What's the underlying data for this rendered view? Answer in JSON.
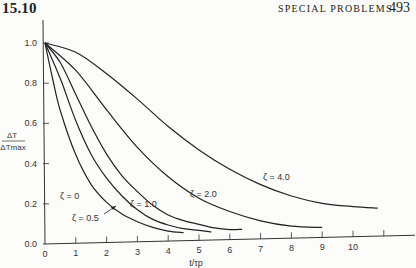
{
  "header": {
    "section": "15.10",
    "running_title": "SPECIAL PROBLEMS",
    "page_number": "493"
  },
  "chart_data": {
    "type": "line",
    "title": "",
    "xlabel": "t/τp",
    "ylabel": "ΔT / ΔTmax",
    "xlim": [
      0,
      11
    ],
    "ylim": [
      0,
      1.0
    ],
    "x_ticks": [
      "0",
      "1",
      "2",
      "3",
      "4",
      "5",
      "6",
      "7",
      "8",
      "9",
      "10",
      ""
    ],
    "y_ticks": [
      "0.0",
      "0.2",
      "0.4",
      "0.6",
      "0.8",
      "1.0"
    ],
    "grid": false,
    "legend": "inline curve labels",
    "series": [
      {
        "name": "ζ = 0",
        "label": "ζ = 0",
        "x": [
          0,
          0.25,
          0.5,
          1,
          1.5,
          2,
          2.5,
          3,
          3.5,
          4,
          4.5
        ],
        "y": [
          1.0,
          0.82,
          0.66,
          0.44,
          0.29,
          0.2,
          0.14,
          0.1,
          0.07,
          0.05,
          0.04
        ]
      },
      {
        "name": "ζ = 0.5",
        "label": "ζ = 0.5",
        "x": [
          0,
          0.5,
          1,
          1.5,
          2,
          2.5,
          3,
          3.5,
          4,
          4.5,
          5,
          5.4
        ],
        "y": [
          1.0,
          0.82,
          0.61,
          0.44,
          0.32,
          0.23,
          0.16,
          0.11,
          0.08,
          0.06,
          0.05,
          0.04
        ]
      },
      {
        "name": "ζ = 1.0",
        "label": "ζ = 1.0",
        "x": [
          0,
          0.5,
          1,
          1.5,
          2,
          2.5,
          3,
          3.5,
          4,
          4.5,
          5,
          5.5,
          6,
          6.4
        ],
        "y": [
          1.0,
          0.9,
          0.74,
          0.58,
          0.44,
          0.33,
          0.25,
          0.18,
          0.13,
          0.1,
          0.08,
          0.06,
          0.05,
          0.05
        ]
      },
      {
        "name": "ζ = 2.0",
        "label": "ζ = 2.0",
        "x": [
          0,
          1,
          2,
          3,
          4,
          5,
          6,
          7,
          8,
          9
        ],
        "y": [
          1.0,
          0.86,
          0.66,
          0.47,
          0.32,
          0.21,
          0.14,
          0.09,
          0.06,
          0.05
        ]
      },
      {
        "name": "ζ = 4.0",
        "label": "ζ = 4.0",
        "x": [
          0,
          1,
          2,
          3,
          4,
          5,
          6,
          7,
          8,
          9,
          10,
          10.8
        ],
        "y": [
          1.0,
          0.95,
          0.84,
          0.71,
          0.57,
          0.45,
          0.35,
          0.27,
          0.21,
          0.17,
          0.15,
          0.14
        ]
      }
    ]
  }
}
